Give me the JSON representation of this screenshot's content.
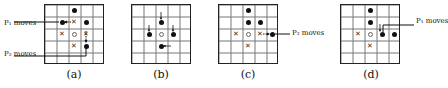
{
  "figure": {
    "panels": [
      {
        "id": "a",
        "label": "(a)",
        "grid_size": 5,
        "dots": [
          [
            0,
            2
          ],
          [
            1,
            1
          ],
          [
            1,
            3
          ],
          [
            3,
            3
          ]
        ],
        "crosses": [
          [
            1,
            2
          ],
          [
            2,
            1
          ],
          [
            2,
            3
          ],
          [
            3,
            2
          ]
        ],
        "center_circle": [
          2,
          2
        ],
        "arrows": [
          {
            "from": [
              1,
              2
            ],
            "to": [
              1,
              1
            ],
            "style": "dotted"
          },
          {
            "from": [
              2,
              3
            ],
            "to": [
              3,
              3
            ],
            "style": "dotted"
          }
        ],
        "callouts": [
          {
            "text": "P₁ moves",
            "points_to": [
              1,
              1
            ],
            "side": "left"
          },
          {
            "text": "P₂ moves",
            "points_to": [
              3,
              3
            ],
            "side": "left"
          }
        ]
      },
      {
        "id": "b",
        "label": "(b)",
        "grid_size": 5,
        "dots": [
          [
            1,
            2
          ],
          [
            2,
            1
          ],
          [
            2,
            3
          ],
          [
            3,
            2
          ]
        ],
        "crosses": [],
        "center_circle": [
          2,
          2
        ],
        "arrows": [
          {
            "direction": "down",
            "into": [
              1,
              2
            ]
          },
          {
            "direction": "down",
            "into": [
              2,
              1
            ]
          },
          {
            "direction": "down",
            "into": [
              2,
              3
            ]
          },
          {
            "direction": "left",
            "into": [
              3,
              2
            ]
          }
        ],
        "callouts": []
      },
      {
        "id": "c",
        "label": "(c)",
        "grid_size": 5,
        "dots": [
          [
            0,
            2
          ],
          [
            1,
            2
          ],
          [
            1,
            3
          ],
          [
            2,
            4
          ]
        ],
        "crosses": [
          [
            2,
            1
          ],
          [
            2,
            3
          ],
          [
            3,
            2
          ]
        ],
        "center_circle": [
          2,
          2
        ],
        "arrows": [
          {
            "from": [
              2,
              3
            ],
            "to": [
              2,
              4
            ],
            "style": "dotted"
          }
        ],
        "callouts": [
          {
            "text": "P₂ moves",
            "points_to": [
              2,
              4
            ],
            "side": "right"
          }
        ]
      },
      {
        "id": "d",
        "label": "(d)",
        "grid_size": 5,
        "dots": [
          [
            0,
            2
          ],
          [
            1,
            2
          ],
          [
            2,
            3
          ],
          [
            2,
            4
          ]
        ],
        "crosses": [
          [
            2,
            1
          ],
          [
            3,
            2
          ]
        ],
        "center_circle": [
          2,
          2
        ],
        "arrows": [
          {
            "direction": "down",
            "into": [
              2,
              3
            ]
          }
        ],
        "callouts": [
          {
            "text": "P₁ moves",
            "points_to": [
              2,
              3
            ],
            "side": "right"
          }
        ]
      }
    ],
    "labels": {
      "a": "(a)",
      "b": "(b)",
      "c": "(c)",
      "d": "(d)",
      "p1_moves": "P₁ moves",
      "p2_moves": "P₂ moves"
    }
  }
}
